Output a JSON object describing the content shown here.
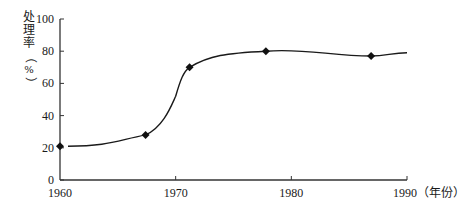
{
  "chart_data": {
    "type": "line",
    "title": "",
    "xlabel": "（年份）",
    "ylabel": "处理率（%）",
    "ylabel_chars": [
      "处",
      "理",
      "率",
      "（",
      "%",
      "）"
    ],
    "xlim": [
      1960,
      1990
    ],
    "ylim": [
      0,
      100
    ],
    "x_ticks": [
      1960,
      1970,
      1980,
      1990
    ],
    "x_tick_labels": [
      "1960",
      "1970",
      "1980",
      "1990"
    ],
    "y_ticks": [
      0,
      20,
      40,
      60,
      80,
      100
    ],
    "y_tick_labels": [
      "0",
      "20",
      "40",
      "60",
      "80",
      "100"
    ],
    "grid": false,
    "legend": null,
    "marker": "diamond",
    "series": [
      {
        "name": "处理率",
        "x": [
          1960,
          1967.4,
          1971.2,
          1977.8,
          1986.9
        ],
        "values": [
          21,
          28,
          70,
          80,
          77
        ],
        "color": "#1a1a1a"
      }
    ],
    "curve_end": {
      "x": 1990,
      "y": 79
    }
  }
}
